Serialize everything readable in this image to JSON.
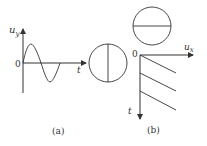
{
  "figure": {
    "panel_a": {
      "caption": "(a)",
      "y_axis_label": "u",
      "y_axis_sub": "y",
      "x_axis_label": "t",
      "origin_label": "0",
      "waveform": "sine",
      "screen_pattern": "vertical-line"
    },
    "panel_b": {
      "caption": "(b)",
      "x_axis_label": "u",
      "x_axis_sub": "x",
      "t_axis_label": "t",
      "origin_label": "0",
      "waveform": "sawtooth",
      "screen_pattern": "horizontal-line"
    }
  },
  "colors": {
    "stroke": "#333333",
    "background": "#ffffff"
  }
}
